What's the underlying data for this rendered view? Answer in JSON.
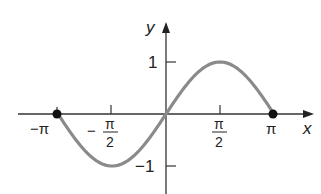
{
  "chart_data": {
    "type": "line",
    "title": "",
    "function": "y = sin(x), -π ≤ x ≤ π",
    "xlabel": "x",
    "ylabel": "y",
    "xlim": [
      -3.14159,
      3.14159
    ],
    "ylim": [
      -1,
      1
    ],
    "x_ticks": [
      {
        "value": -3.14159,
        "label": "−π"
      },
      {
        "value": -1.5708,
        "label": "−π/2",
        "num": "π",
        "den": "2",
        "sign": "−"
      },
      {
        "value": 1.5708,
        "label": "π/2",
        "num": "π",
        "den": "2",
        "sign": ""
      },
      {
        "value": 3.14159,
        "label": "π"
      }
    ],
    "y_ticks": [
      {
        "value": 1,
        "label": "1"
      },
      {
        "value": -1,
        "label": "−1"
      }
    ],
    "series": [
      {
        "name": "sin x",
        "color": "#8a8a8a",
        "x": [
          -3.14159,
          -2.3562,
          -1.5708,
          -0.7854,
          0,
          0.7854,
          1.5708,
          2.3562,
          3.14159
        ],
        "values": [
          0,
          -0.7071,
          -1,
          -0.7071,
          0,
          0.7071,
          1,
          0.7071,
          0
        ]
      }
    ],
    "endpoints": [
      {
        "x": -3.14159,
        "y": 0,
        "filled": true
      },
      {
        "x": 3.14159,
        "y": 0,
        "filled": true
      }
    ],
    "grid": false,
    "legend": null
  },
  "labels": {
    "x_axis": "x",
    "y_axis": "y",
    "neg_pi": "−π",
    "pi": "π",
    "half_pi_num": "π",
    "half_pi_den": "2",
    "minus": "−",
    "y_one": "1",
    "y_neg_one": "−1"
  }
}
